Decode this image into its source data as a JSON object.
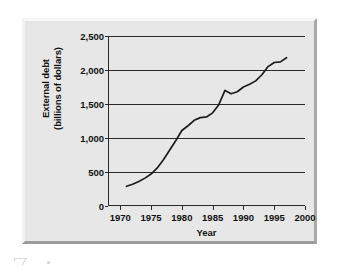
{
  "chart_data": {
    "type": "line",
    "title": "",
    "xlabel": "Year",
    "ylabel": "External debt\n(billions of dollars)",
    "ylabel_line1": "External debt",
    "ylabel_line2": "(billions of dollars)",
    "xlim": [
      1968,
      2000
    ],
    "ylim": [
      0,
      2500
    ],
    "xticks": [
      1970,
      1975,
      1980,
      1985,
      1990,
      1995,
      2000
    ],
    "xtick_labels": [
      "1970",
      "1975",
      "1980",
      "1985",
      "1990",
      "1995",
      "2000"
    ],
    "yticks": [
      0,
      500,
      1000,
      1500,
      2000,
      2500
    ],
    "ytick_labels": [
      "0",
      "500",
      "1,000",
      "1,500",
      "2,000",
      "2,500"
    ],
    "grid": "horizontal",
    "legend": "none",
    "series_color": "#1c1c1c",
    "x": [
      1971,
      1972,
      1973,
      1974,
      1975,
      1976,
      1977,
      1978,
      1979,
      1980,
      1981,
      1982,
      1983,
      1984,
      1985,
      1986,
      1987,
      1988,
      1989,
      1990,
      1991,
      1992,
      1993,
      1994,
      1995,
      1996,
      1997
    ],
    "values": [
      290,
      320,
      360,
      410,
      470,
      560,
      680,
      820,
      960,
      1110,
      1180,
      1260,
      1300,
      1310,
      1370,
      1490,
      1700,
      1650,
      1680,
      1750,
      1790,
      1840,
      1930,
      2050,
      2110,
      2120,
      2180
    ],
    "series": [
      {
        "name": "External debt",
        "values": [
          290,
          320,
          360,
          410,
          470,
          560,
          680,
          820,
          960,
          1110,
          1180,
          1260,
          1300,
          1310,
          1370,
          1490,
          1700,
          1650,
          1680,
          1750,
          1790,
          1840,
          1930,
          2050,
          2110,
          2120,
          2180
        ]
      }
    ]
  },
  "artifact": {
    "name": "scan-artifact"
  }
}
